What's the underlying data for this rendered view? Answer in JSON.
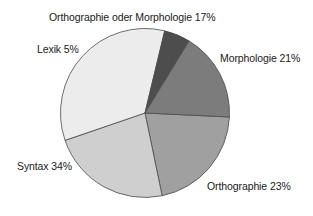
{
  "chart_data": {
    "type": "pie",
    "title": "",
    "categories": [
      "Morphologie",
      "Orthographie",
      "Syntax",
      "Lexik",
      "Orthographie oder Morphologie"
    ],
    "values": [
      21,
      23,
      34,
      5,
      17
    ],
    "unit": "%",
    "labels": [
      "Morphologie 21%",
      "Orthographie 23%",
      "Syntax 34%",
      "Lexik 5%",
      "Orthographie oder Morphologie 17%"
    ],
    "colors": [
      "#a0a0a0",
      "#cfcfcf",
      "#ececec",
      "#4d4d4d",
      "#7c7c7c"
    ],
    "start_angle_deg": 2.7,
    "direction": "clockwise",
    "legend": "none",
    "data_labels": "outside, category name and percent"
  },
  "labels": {
    "morphologie": "Morphologie 21%",
    "orthographie": "Orthographie 23%",
    "syntax": "Syntax 34%",
    "lexik": "Lexik 5%",
    "orth_oder_morph": "Orthographie oder Morphologie 17%"
  }
}
